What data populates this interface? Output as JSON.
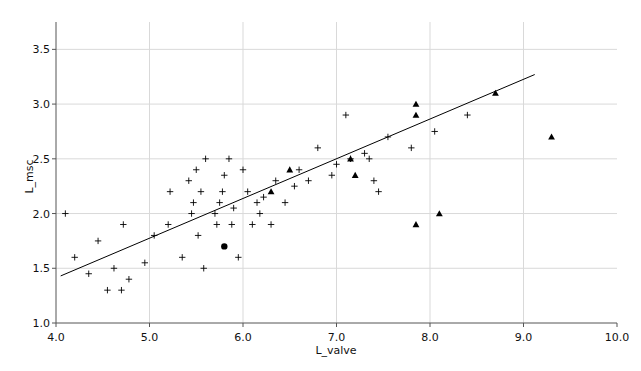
{
  "chart_data": {
    "type": "scatter",
    "title": "",
    "xlabel": "L_valve",
    "ylabel": "L_msc",
    "xlim": [
      4.0,
      10.0
    ],
    "ylim": [
      1.0,
      3.75
    ],
    "xticks": [
      4.0,
      5.0,
      6.0,
      7.0,
      8.0,
      9.0,
      10.0
    ],
    "xtick_labels": [
      "4.0",
      "5.0",
      "6.0",
      "7.0",
      "8.0",
      "9.0",
      "10.0"
    ],
    "yticks": [
      1.0,
      1.5,
      2.0,
      2.5,
      3.0,
      3.5
    ],
    "ytick_labels": [
      "1.0",
      "1.5",
      "2.0",
      "2.5",
      "3.0",
      "3.5"
    ],
    "grid": true,
    "grid_color": "#d9d9d9",
    "axis_color": "#555555",
    "marker_color": "#000000",
    "legend_position": "none",
    "series": [
      {
        "name": "plus-markers",
        "marker": "plus",
        "points": [
          [
            4.1,
            2.0
          ],
          [
            4.2,
            1.6
          ],
          [
            4.35,
            1.45
          ],
          [
            4.45,
            1.75
          ],
          [
            4.55,
            1.3
          ],
          [
            4.62,
            1.5
          ],
          [
            4.7,
            1.3
          ],
          [
            4.72,
            1.9
          ],
          [
            4.78,
            1.4
          ],
          [
            4.95,
            1.55
          ],
          [
            5.05,
            1.8
          ],
          [
            5.2,
            1.9
          ],
          [
            5.22,
            2.2
          ],
          [
            5.35,
            1.6
          ],
          [
            5.42,
            2.3
          ],
          [
            5.45,
            2.0
          ],
          [
            5.47,
            2.1
          ],
          [
            5.5,
            2.4
          ],
          [
            5.52,
            1.8
          ],
          [
            5.55,
            2.2
          ],
          [
            5.58,
            1.5
          ],
          [
            5.6,
            2.5
          ],
          [
            5.7,
            2.0
          ],
          [
            5.72,
            1.9
          ],
          [
            5.75,
            2.1
          ],
          [
            5.78,
            2.2
          ],
          [
            5.8,
            2.35
          ],
          [
            5.85,
            2.5
          ],
          [
            5.88,
            1.9
          ],
          [
            5.9,
            2.05
          ],
          [
            5.95,
            1.6
          ],
          [
            6.0,
            2.4
          ],
          [
            6.05,
            2.2
          ],
          [
            6.1,
            1.9
          ],
          [
            6.15,
            2.1
          ],
          [
            6.18,
            2.0
          ],
          [
            6.22,
            2.15
          ],
          [
            6.3,
            1.9
          ],
          [
            6.35,
            2.3
          ],
          [
            6.45,
            2.1
          ],
          [
            6.55,
            2.25
          ],
          [
            6.6,
            2.4
          ],
          [
            6.7,
            2.3
          ],
          [
            6.8,
            2.6
          ],
          [
            6.95,
            2.35
          ],
          [
            7.0,
            2.45
          ],
          [
            7.1,
            2.9
          ],
          [
            7.15,
            2.5
          ],
          [
            7.3,
            2.55
          ],
          [
            7.35,
            2.5
          ],
          [
            7.4,
            2.3
          ],
          [
            7.45,
            2.2
          ],
          [
            7.55,
            2.7
          ],
          [
            7.8,
            2.6
          ],
          [
            8.05,
            2.75
          ],
          [
            8.4,
            2.9
          ]
        ]
      },
      {
        "name": "triangle-markers",
        "marker": "triangle",
        "points": [
          [
            6.5,
            2.4
          ],
          [
            6.3,
            2.2
          ],
          [
            7.15,
            2.5
          ],
          [
            7.2,
            2.35
          ],
          [
            7.85,
            3.0
          ],
          [
            7.85,
            2.9
          ],
          [
            7.85,
            1.9
          ],
          [
            8.1,
            2.0
          ],
          [
            8.7,
            3.1
          ],
          [
            9.3,
            2.7
          ]
        ]
      },
      {
        "name": "circle-marker",
        "marker": "filled-circle",
        "points": [
          [
            5.8,
            1.7
          ]
        ]
      }
    ],
    "trendline": {
      "name": "regression-line",
      "x0": 4.05,
      "y0": 1.43,
      "x1": 9.12,
      "y1": 3.27,
      "color": "#000000",
      "width": 1
    }
  },
  "caption": {
    "text": ""
  }
}
